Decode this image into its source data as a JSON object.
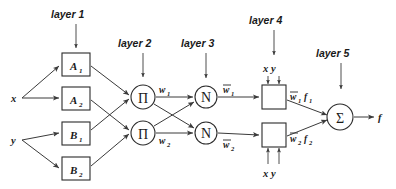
{
  "diagram": {
    "type": "neural-network-diagram",
    "colors": {
      "stroke": "#2b2b2b",
      "edge": "#3a3a3a",
      "text": "#1a1a1a",
      "background": "#ffffff"
    },
    "layer_labels": [
      {
        "text": "layer 1",
        "x": 78,
        "y": 16
      },
      {
        "text": "layer 2",
        "x": 137,
        "y": 45
      },
      {
        "text": "layer 3",
        "x": 201,
        "y": 45
      },
      {
        "text": "layer 4",
        "x": 268,
        "y": 22
      },
      {
        "text": "layer 5",
        "x": 334,
        "y": 55
      }
    ],
    "inputs": [
      {
        "label": "x",
        "x": 10,
        "y": 99
      },
      {
        "label": "y",
        "x": 10,
        "y": 143
      }
    ],
    "output": {
      "label": "f",
      "x": 380,
      "y": 118
    },
    "layer1_nodes": [
      {
        "base": "A",
        "sub": "1",
        "x": 62,
        "y": 53,
        "w": 28,
        "h": 23
      },
      {
        "base": "A",
        "sub": "2",
        "x": 62,
        "y": 87,
        "w": 28,
        "h": 23
      },
      {
        "base": "B",
        "sub": "1",
        "x": 62,
        "y": 122,
        "w": 28,
        "h": 23
      },
      {
        "base": "B",
        "sub": "2",
        "x": 62,
        "y": 157,
        "w": 28,
        "h": 23
      }
    ],
    "layer2_nodes": [
      {
        "symbol": "Π",
        "name": "product-node-1",
        "cx": 143,
        "cy": 97,
        "r": 12
      },
      {
        "symbol": "Π",
        "name": "product-node-2",
        "cx": 143,
        "cy": 133,
        "r": 12
      }
    ],
    "layer3_nodes": [
      {
        "symbol": "N",
        "name": "normalize-node-1",
        "cx": 206,
        "cy": 97,
        "r": 11
      },
      {
        "symbol": "N",
        "name": "normalize-node-2",
        "cx": 206,
        "cy": 133,
        "r": 11
      }
    ],
    "layer4_nodes": [
      {
        "x": 262,
        "y": 85,
        "w": 24,
        "h": 24,
        "name": "consequent-node-1"
      },
      {
        "x": 262,
        "y": 123,
        "w": 24,
        "h": 24,
        "name": "consequent-node-2"
      }
    ],
    "layer5_node": {
      "symbol": "Σ",
      "name": "sum-node",
      "cx": 340,
      "cy": 117,
      "r": 13
    },
    "layer4_extra_inputs": [
      {
        "labels": "x  y",
        "position": "top",
        "x": 265,
        "y": 74
      },
      {
        "labels": "x  y",
        "position": "bottom",
        "x": 265,
        "y": 173
      }
    ],
    "edge_labels": [
      {
        "base": "w",
        "sub": "1",
        "bar": false,
        "x": 160,
        "y": 91,
        "name": "weight-w1"
      },
      {
        "base": "w",
        "sub": "2",
        "bar": false,
        "x": 160,
        "y": 142,
        "name": "weight-w2"
      },
      {
        "base": "w",
        "sub": "1",
        "bar": true,
        "x": 224,
        "y": 90,
        "name": "normalized-weight-w1"
      },
      {
        "base": "w",
        "sub": "2",
        "bar": true,
        "x": 224,
        "y": 145,
        "name": "normalized-weight-w2"
      },
      {
        "base": "w",
        "sub": "1",
        "bar": true,
        "extra": "f",
        "extra_sub": "1",
        "x": 291,
        "y": 98,
        "name": "weighted-output-1"
      },
      {
        "base": "w",
        "sub": "2",
        "bar": true,
        "extra": "f",
        "extra_sub": "2",
        "x": 291,
        "y": 140,
        "name": "weighted-output-2"
      }
    ]
  }
}
